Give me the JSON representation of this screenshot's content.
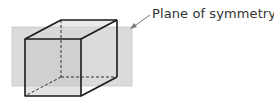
{
  "diagram": {
    "label": "Plane of symmetry",
    "colors": {
      "plane": "#c8c8c8",
      "edge": "#1a1a1a",
      "arrow": "#777777",
      "text": "#333333"
    },
    "shapes": {
      "front_face": {
        "x": 25,
        "y": 39,
        "w": 56,
        "h": 57
      },
      "back_face": {
        "x": 61,
        "y": 20,
        "w": 56,
        "h": 57
      },
      "plane": {
        "x": 12,
        "y": 27,
        "w": 120,
        "h": 59
      }
    }
  }
}
